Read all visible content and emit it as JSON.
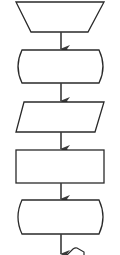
{
  "diagram": {
    "type": "flowchart",
    "orientation": "vertical",
    "stroke_color": "#2a2a2a",
    "fill_color": "#ffffff",
    "arrow_color": "#3a3a3a",
    "nodes": [
      {
        "id": "n1",
        "shape": "manual-operation-trapezoid",
        "label": ""
      },
      {
        "id": "n2",
        "shape": "terminal-rounded",
        "label": ""
      },
      {
        "id": "n3",
        "shape": "data-parallelogram",
        "label": ""
      },
      {
        "id": "n4",
        "shape": "process-rectangle",
        "label": ""
      },
      {
        "id": "n5",
        "shape": "terminal-rounded",
        "label": ""
      },
      {
        "id": "n6",
        "shape": "preparation-hexagon-partial",
        "label": ""
      }
    ],
    "edges": [
      {
        "from": "n1",
        "to": "n2"
      },
      {
        "from": "n2",
        "to": "n3"
      },
      {
        "from": "n3",
        "to": "n4"
      },
      {
        "from": "n4",
        "to": "n5"
      },
      {
        "from": "n5",
        "to": "n6"
      }
    ]
  }
}
